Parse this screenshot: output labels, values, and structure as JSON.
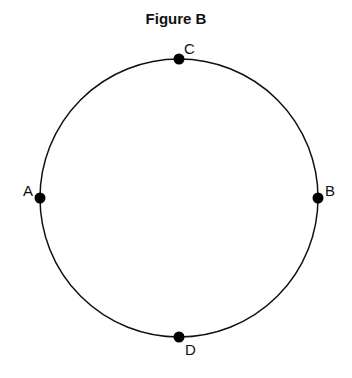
{
  "title": "Figure B",
  "points": [
    {
      "label": "C",
      "position": "top"
    },
    {
      "label": "A",
      "position": "left"
    },
    {
      "label": "B",
      "position": "right"
    },
    {
      "label": "D",
      "position": "bottom"
    }
  ],
  "colors": {
    "stroke": "#111111",
    "point": "#000000",
    "background": "#ffffff"
  }
}
